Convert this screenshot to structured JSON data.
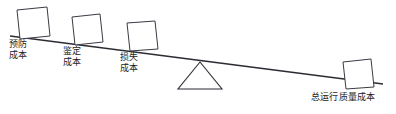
{
  "diagram": {
    "type": "lever-balance-diagram",
    "background_color": "#ffffff",
    "line_color": "#2b2b33",
    "box_fill": "#ffffff",
    "labels": {
      "prevention": {
        "line1": "预防",
        "line2": "成本",
        "full": "预防成本"
      },
      "appraisal": {
        "line1": "鉴定",
        "line2": "成本",
        "full": "鉴定成本"
      },
      "failure": {
        "line1": "损失",
        "line2": "成本",
        "full": "损失成本"
      },
      "total": {
        "line1": "总运行质量成本",
        "full": "总运行质量成本"
      }
    },
    "elements": {
      "beam_name": "tilted-beam",
      "fulcrum_name": "triangular-fulcrum",
      "left_weights": 3,
      "right_weights": 1
    }
  }
}
